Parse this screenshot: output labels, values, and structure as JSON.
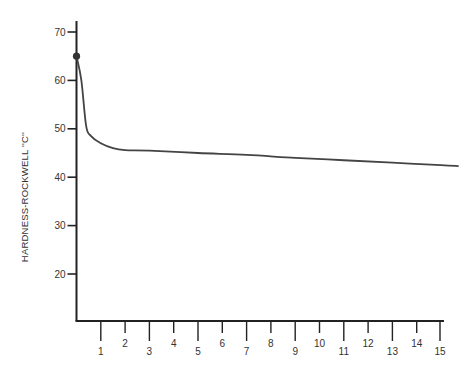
{
  "chart_data": {
    "type": "line",
    "title": "",
    "xlabel": "",
    "ylabel": "HARDNESS-ROCKWELL ''C''",
    "xlim": [
      0,
      15.7
    ],
    "ylim": [
      10,
      72
    ],
    "grid": false,
    "legend": null,
    "x_ticks": [
      1,
      2,
      3,
      4,
      5,
      6,
      7,
      8,
      9,
      10,
      11,
      12,
      13,
      14,
      15
    ],
    "y_ticks": [
      20,
      30,
      40,
      50,
      60,
      70
    ],
    "series": [
      {
        "name": "hardness",
        "x": [
          0,
          0.2,
          0.4,
          0.6,
          1,
          1.5,
          2,
          3,
          5,
          7,
          9,
          11,
          13,
          15,
          15.7
        ],
        "values": [
          65,
          60,
          50.5,
          48.5,
          47,
          46,
          45.6,
          45.5,
          45,
          44.6,
          44,
          43.5,
          43,
          42.5,
          42.3
        ],
        "start_marker": {
          "x": 0,
          "y": 65
        }
      }
    ],
    "colors": {
      "line": "#444444",
      "axis": "#222222",
      "text": "#333333"
    }
  }
}
